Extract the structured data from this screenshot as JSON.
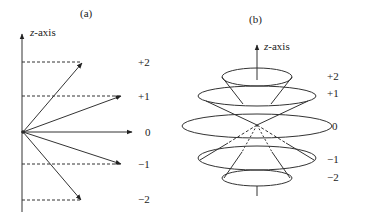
{
  "panel_a": {
    "label": "(a)",
    "axis_label_var": "z",
    "axis_label_suffix": "-axis",
    "levels": [
      "+2",
      "+1",
      "0",
      "−1",
      "−2"
    ]
  },
  "panel_b": {
    "label": "(b)",
    "axis_label_var": "z",
    "axis_label_suffix": "-axis",
    "levels": [
      "+2",
      "+1",
      "0",
      "−1",
      "−2"
    ]
  },
  "colors": {
    "stroke": "#333333",
    "background": "#ffffff"
  }
}
